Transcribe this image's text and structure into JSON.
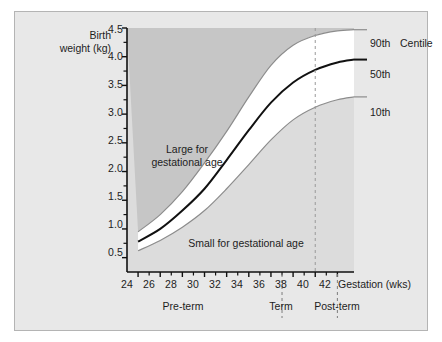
{
  "figure": {
    "background": "#e8e8e8",
    "border_color": "#b4b4b4",
    "plot_background": "#dcdcdc",
    "band_fill": "#ffffff",
    "large_region_fill": "#c6c6c6"
  },
  "chart_data": {
    "type": "line",
    "title": "",
    "xlabel": "Gestation (wks)",
    "ylabel": "Birth weight (kg)",
    "xlim": [
      23,
      43.5
    ],
    "ylim": [
      0.25,
      4.5
    ],
    "grid": false,
    "legend_position": "right-of-curves",
    "x_ticks_major": [
      24,
      26,
      28,
      30,
      32,
      34,
      36,
      38,
      40,
      42
    ],
    "x_ticks_minor": [
      25,
      27,
      29,
      31,
      33,
      35,
      37,
      39,
      41
    ],
    "y_ticks_major": [
      0.5,
      1.0,
      1.5,
      2.0,
      2.5,
      3.0,
      3.5,
      4.0,
      4.5
    ],
    "y_ticks_minor": [
      0.75,
      1.25,
      1.75,
      2.25,
      2.75,
      3.25,
      3.75,
      4.25
    ],
    "x": [
      24,
      26,
      28,
      30,
      32,
      34,
      36,
      38,
      40,
      42,
      43.5
    ],
    "series": [
      {
        "name": "90th",
        "label": "90th",
        "color": "#8c8c8c",
        "values": [
          0.95,
          1.25,
          1.65,
          2.15,
          2.7,
          3.3,
          3.85,
          4.2,
          4.37,
          4.45,
          4.47
        ]
      },
      {
        "name": "50th",
        "label": "50th",
        "color": "#111111",
        "values": [
          0.78,
          1.0,
          1.32,
          1.7,
          2.2,
          2.72,
          3.2,
          3.55,
          3.77,
          3.9,
          3.95
        ]
      },
      {
        "name": "10th",
        "label": "10th",
        "color": "#8c8c8c",
        "values": [
          0.62,
          0.8,
          1.03,
          1.32,
          1.7,
          2.12,
          2.55,
          2.9,
          3.12,
          3.25,
          3.3
        ]
      }
    ],
    "legend_title": "Centile",
    "annotations": [
      {
        "text": "Large for gestational age",
        "x": 29.6,
        "y": 2.45
      },
      {
        "text": "Small for gestational age",
        "x": 33.5,
        "y": 0.83
      }
    ],
    "reference_lines": [
      {
        "name": "term-marker",
        "x": 40,
        "style": "dashed",
        "color": "#9a9a9a"
      }
    ],
    "period_dividers": [
      {
        "x": 37,
        "style": "dashed",
        "color": "#7d7d7d"
      },
      {
        "x": 42,
        "style": "dashed",
        "color": "#7d7d7d"
      }
    ],
    "periods": [
      {
        "label": "Pre-term",
        "x": 30.5
      },
      {
        "label": "Term",
        "x": 39.2
      },
      {
        "label": "Post-term",
        "x": 44.0
      }
    ]
  },
  "labels": {
    "y_axis_line1": "Birth",
    "y_axis_line2": "weight (kg)",
    "x_axis": "Gestation (wks)",
    "centile_header": "Centile",
    "curve_90": "90th",
    "curve_50": "50th",
    "curve_10": "10th",
    "region_large_line1": "Large for",
    "region_large_line2": "gestational age",
    "region_small": "Small for gestational age",
    "period_preterm": "Pre-term",
    "period_term": "Term",
    "period_postterm": "Post-term",
    "y0": "0.5",
    "y1": "1.0",
    "y2": "1.5",
    "y3": "2.0",
    "y4": "2.5",
    "y5": "3.0",
    "y6": "3.5",
    "y7": "4.0",
    "y8": "4.5",
    "x0": "24",
    "x1": "26",
    "x2": "28",
    "x3": "30",
    "x4": "32",
    "x5": "34",
    "x6": "36",
    "x7": "38",
    "x8": "40",
    "x9": "42"
  }
}
